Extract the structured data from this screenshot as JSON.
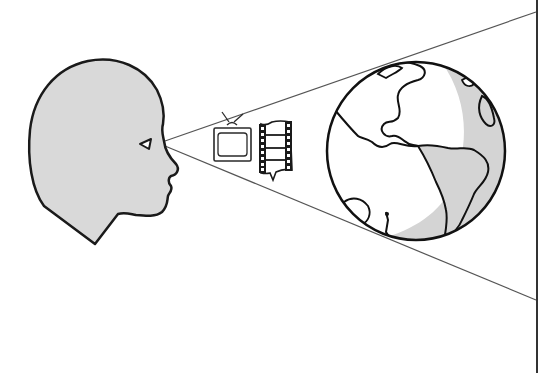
{
  "figure": {
    "elements": {
      "head": {
        "label": "human-head-profile",
        "fill": "#d9d9d9",
        "stroke": "#1a1a1a"
      },
      "eye": {
        "label": "eye"
      },
      "view_cone": {
        "label": "field-of-view-cone",
        "stroke": "#555555"
      },
      "tv": {
        "label": "television",
        "stroke": "#2a2a2a"
      },
      "film": {
        "label": "film-strip",
        "stroke": "#1a1a1a"
      },
      "globe": {
        "label": "earth-globe",
        "land_fill": "#ffffff",
        "shadow_fill": "#d4d4d4",
        "stroke": "#111111"
      },
      "frame_line": {
        "label": "right-border-line",
        "stroke": "#333333"
      }
    },
    "colors": {
      "background": "#ffffff",
      "outline": "#111111",
      "gray_fill": "#d6d6d6",
      "cone_line": "#555555"
    }
  }
}
